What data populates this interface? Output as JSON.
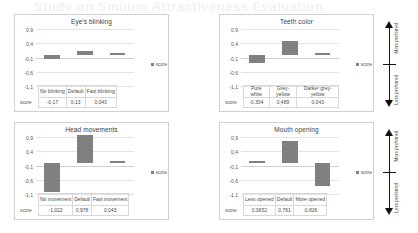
{
  "page": {
    "bleed_text": "Study on Smiling Attractiveness Evaluation"
  },
  "legend_label": "score",
  "score_row_label": "score",
  "preference": {
    "top_label": "More preferred",
    "bottom_label": "Less preferred"
  },
  "axis": {
    "ticks": [
      "0,9",
      "0,4",
      "-0,1",
      "-0,6",
      "-1,1"
    ],
    "ylim": [
      -1.1,
      0.9
    ]
  },
  "chart_data": [
    {
      "type": "bar",
      "title": "Eye's blinking",
      "categories": [
        "No blinking",
        "Default",
        "Fast blinking"
      ],
      "values": [
        -0.17,
        0.13,
        0.043
      ],
      "value_labels": [
        "-0,17",
        "0,13",
        "0,043"
      ],
      "series": [
        {
          "name": "score",
          "values": [
            -0.17,
            0.13,
            0.043
          ]
        }
      ],
      "xlabel": "",
      "ylabel": "score",
      "ylim": [
        -1.1,
        0.9
      ],
      "yticks": [
        "0,9",
        "0,4",
        "-0,1",
        "-0,6",
        "-1,1"
      ],
      "grid": true,
      "legend": "right"
    },
    {
      "type": "bar",
      "title": "Teeth color",
      "categories": [
        "Pure white",
        "Grey-yellow",
        "Darker grey-yellow"
      ],
      "values": [
        -0.304,
        0.489,
        0.043
      ],
      "value_labels": [
        "-0,304",
        "0,489",
        "0,043"
      ],
      "series": [
        {
          "name": "score",
          "values": [
            -0.304,
            0.489,
            0.043
          ]
        }
      ],
      "xlabel": "",
      "ylabel": "score",
      "ylim": [
        -1.1,
        0.9
      ],
      "yticks": [
        "0,9",
        "0,4",
        "-0,1",
        "-0,6",
        "-1,1"
      ],
      "grid": true,
      "legend": "right"
    },
    {
      "type": "bar",
      "title": "Head movements",
      "categories": [
        "No movement",
        "Default",
        "Fast movement"
      ],
      "values": [
        -1.022,
        0.978,
        0.043
      ],
      "value_labels": [
        "-1,022",
        "0,978",
        "0,043"
      ],
      "series": [
        {
          "name": "score",
          "values": [
            -1.022,
            0.978,
            0.043
          ]
        }
      ],
      "xlabel": "",
      "ylabel": "score",
      "ylim": [
        -1.1,
        0.9
      ],
      "yticks": [
        "0,9",
        "0,4",
        "-0,1",
        "-0,6",
        "-1,1"
      ],
      "grid": true,
      "legend": "right"
    },
    {
      "type": "bar",
      "title": "Mouth opening",
      "categories": [
        "Less opened",
        "Default",
        "More opened"
      ],
      "values": [
        0.0652,
        0.761,
        -0.826
      ],
      "value_labels": [
        "0,0652",
        "0,761",
        "-0,826"
      ],
      "series": [
        {
          "name": "score",
          "values": [
            0.0652,
            0.761,
            -0.826
          ]
        }
      ],
      "xlabel": "",
      "ylabel": "score",
      "ylim": [
        -1.1,
        0.9
      ],
      "yticks": [
        "0,9",
        "0,4",
        "-0,1",
        "-0,6",
        "-1,1"
      ],
      "grid": true,
      "legend": "right"
    }
  ]
}
